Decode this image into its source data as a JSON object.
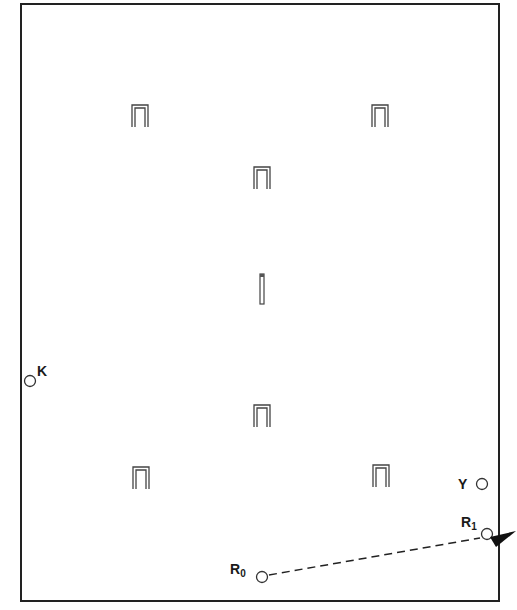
{
  "diagram": {
    "type": "croquet-court-layout",
    "court": {
      "x1": 21,
      "y1": 4,
      "x2": 499,
      "y2": 601,
      "stroke": "#222222"
    },
    "hoops": [
      {
        "name": "hoop-1",
        "x": 140,
        "y": 105
      },
      {
        "name": "hoop-2",
        "x": 380,
        "y": 105
      },
      {
        "name": "hoop-3",
        "x": 262,
        "y": 168
      },
      {
        "name": "hoop-4",
        "x": 262,
        "y": 405
      },
      {
        "name": "hoop-5",
        "x": 140,
        "y": 467
      },
      {
        "name": "hoop-6",
        "x": 380,
        "y": 467
      }
    ],
    "peg": {
      "name": "center-peg",
      "x": 262,
      "y": 276
    },
    "balls": [
      {
        "id": "K",
        "label": "K",
        "sub": "",
        "x": 30,
        "y": 381,
        "label_x": 37,
        "label_y": 364
      },
      {
        "id": "Y",
        "label": "Y",
        "sub": "",
        "x": 482,
        "y": 484,
        "label_x": 458,
        "label_y": 477
      },
      {
        "id": "R1",
        "label": "R",
        "sub": "1",
        "x": 487,
        "y": 534,
        "label_x": 461,
        "label_y": 515
      },
      {
        "id": "R0",
        "label": "R",
        "sub": "0",
        "x": 262,
        "y": 577,
        "label_x": 230,
        "label_y": 562
      }
    ],
    "path": {
      "from": "R0",
      "to": "R1",
      "style": "dashed"
    },
    "arrow": {
      "x": 488,
      "y": 539,
      "direction": "left-down",
      "color": "#111111"
    }
  }
}
